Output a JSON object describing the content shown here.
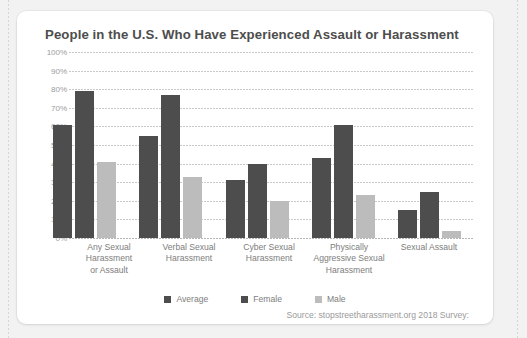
{
  "card": {
    "title": "People in the U.S. Who Have Experienced Assault or Harassment",
    "source": "Source: stopstreetharassment.org 2018 Survey:"
  },
  "colors": {
    "average": "#4d4d4d",
    "female": "#4d4d4d",
    "male": "#bcbcbc",
    "title_text": "#4d4d4d",
    "axis_text": "#9c9c9c",
    "label_text": "#7d7d7d",
    "gridline": "#c9c9c9",
    "card_background": "#ffffff",
    "page_background": "#f2f2f2"
  },
  "legend": {
    "position": "bottom-center",
    "items": [
      {
        "label": "Average",
        "color": "#4d4d4d"
      },
      {
        "label": "Female",
        "color": "#4d4d4d"
      },
      {
        "label": "Male",
        "color": "#bcbcbc"
      }
    ]
  },
  "chart_data": {
    "type": "bar",
    "title": "People in the U.S. Who Have Experienced Assault or Harassment",
    "xlabel": "",
    "ylabel": "",
    "ylim": [
      0,
      100
    ],
    "yticks": [
      0,
      10,
      20,
      30,
      40,
      50,
      60,
      70,
      80,
      90,
      100
    ],
    "ytick_labels": [
      "0%",
      "10%",
      "20%",
      "30%",
      "40%",
      "50%",
      "60%",
      "70%",
      "80%",
      "90%",
      "100%"
    ],
    "grid": true,
    "grid_axis": "y",
    "grid_style": "dotted",
    "legend_position": "bottom-center",
    "categories": [
      "Any Sexual Harassment or Assault",
      "Verbal Sexual Harassment",
      "Cyber Sexual Harassment",
      "Physically Aggressive Sexual Harassment",
      "Sexual Assault"
    ],
    "category_lines": [
      [
        "Any Sexual",
        "Harassment",
        "or Assault"
      ],
      [
        "Verbal Sexual",
        "Harassment"
      ],
      [
        "Cyber Sexual",
        "Harassment"
      ],
      [
        "Physically",
        "Aggressive Sexual",
        "Harassment"
      ],
      [
        "Sexual Assault"
      ]
    ],
    "series": [
      {
        "name": "Average",
        "color": "#4d4d4d",
        "values": [
          61,
          55,
          31,
          43,
          15
        ]
      },
      {
        "name": "Female",
        "color": "#4d4d4d",
        "values": [
          79,
          77,
          40,
          61,
          25
        ]
      },
      {
        "name": "Male",
        "color": "#bcbcbc",
        "values": [
          41,
          33,
          20,
          23,
          4
        ]
      }
    ],
    "source": "Source: stopstreetharassment.org 2018 Survey:"
  }
}
